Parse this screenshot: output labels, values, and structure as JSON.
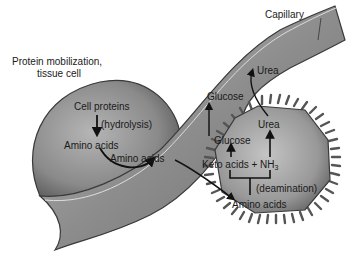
{
  "labels": {
    "tissue_title_line1": "Protein mobilization,",
    "tissue_title_line2": "tissue cell",
    "capillary": "Capillary",
    "cell_proteins": "Cell proteins",
    "hydrolysis": "(hydrolysis)",
    "amino_acids_tissue": "Amino acids",
    "amino_acids_capillary": "Amino acids",
    "glucose_capillary": "Glucose",
    "urea_capillary": "Urea",
    "glucose_liver": "Glucose",
    "urea_liver": "Urea",
    "keto_acids": "Keto acids + NH",
    "nh3_subscript": "3",
    "deamination": "(deamination)",
    "amino_acids_liver": "Amino acids"
  },
  "colors": {
    "background": "#ffffff",
    "cell_fill": "#8c8c8c",
    "capillary_fill": "#9a9a9a",
    "liver_fill": "#a0a0a0",
    "outline": "#3a3a3a",
    "arrow": "#111111"
  }
}
